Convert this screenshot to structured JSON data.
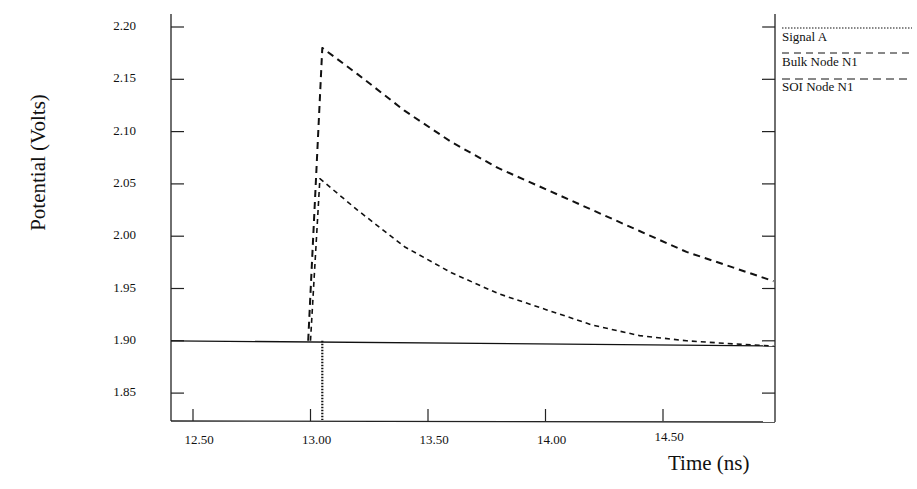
{
  "chart_data": {
    "type": "line",
    "title": "",
    "xlabel": "Time (ns)",
    "ylabel": "Potential (Volts)",
    "xlim": [
      12.4,
      14.97
    ],
    "ylim": [
      1.82,
      2.21
    ],
    "grid": false,
    "legend_position": "right-outside-top",
    "x_ticks": [
      "12.50",
      "13.00",
      "13.50",
      "14.00",
      "14.50"
    ],
    "y_ticks": [
      "2.20",
      "2.15",
      "2.10",
      "2.05",
      "2.00",
      "1.95",
      "1.90",
      "1.85"
    ],
    "series": [
      {
        "name": "Signal A",
        "style": "dotted",
        "x": [
          13.05,
          13.05
        ],
        "y": [
          1.9,
          1.82
        ]
      },
      {
        "name": "Bulk Node N1",
        "style": "dashed",
        "x": [
          12.99,
          13.05,
          13.2,
          13.4,
          13.6,
          13.8,
          14.0,
          14.2,
          14.4,
          14.6,
          14.8,
          14.97
        ],
        "y": [
          1.9,
          2.18,
          2.155,
          2.12,
          2.09,
          2.065,
          2.045,
          2.025,
          2.005,
          1.985,
          1.97,
          1.957
        ]
      },
      {
        "name": "SOI Node N1",
        "style": "dashed-fine",
        "x": [
          13.0,
          13.04,
          13.2,
          13.4,
          13.6,
          13.8,
          14.0,
          14.2,
          14.4,
          14.6,
          14.8,
          14.97
        ],
        "y": [
          1.9,
          2.055,
          2.025,
          1.99,
          1.965,
          1.945,
          1.93,
          1.915,
          1.905,
          1.9,
          1.897,
          1.895
        ]
      },
      {
        "name": "Baseline",
        "style": "solid",
        "x": [
          12.4,
          14.97
        ],
        "y": [
          1.9,
          1.895
        ]
      }
    ]
  },
  "legend": {
    "items": [
      {
        "label": "Signal A",
        "style": "dotted"
      },
      {
        "label": "Bulk Node N1",
        "style": "dashed"
      },
      {
        "label": "SOI Node N1",
        "style": "dashed-long"
      }
    ]
  },
  "axes": {
    "x_title": "Time (ns)",
    "y_title": "Potential (Volts)"
  },
  "colors": {
    "line": "#111111",
    "background": "#ffffff"
  }
}
